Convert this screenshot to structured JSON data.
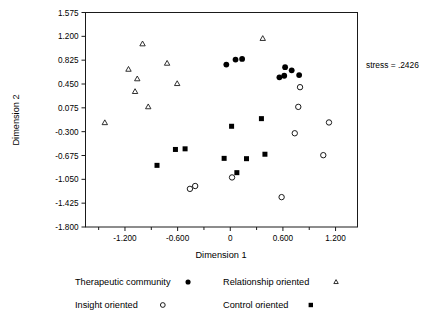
{
  "chart_data": {
    "type": "scatter",
    "title": "",
    "subtitle": "",
    "xlabel": "Dimension 1",
    "ylabel": "Dimension 2",
    "xlim": [
      -1.65,
      1.45
    ],
    "ylim": [
      -1.8,
      1.575
    ],
    "grid": false,
    "legend_position": "below-plot",
    "annotations": [
      {
        "name": "stress-annotation",
        "text": "stress = .2426",
        "value": 0.2426
      }
    ],
    "xticks": [
      -1.2,
      -0.6,
      0,
      0.6,
      1.2
    ],
    "xtick_labels": [
      "-1.200",
      "-0.600",
      "0",
      "0.600",
      "1.200"
    ],
    "yticks": [
      1.575,
      1.2,
      0.825,
      0.45,
      0.075,
      -0.3,
      -0.675,
      -1.05,
      -1.425,
      -1.8
    ],
    "ytick_labels": [
      "1.575",
      "1.200",
      "0.825",
      "0.450",
      "0.075",
      "-0.300",
      "-0.675",
      "-1.050",
      "-1.425",
      "-1.800"
    ],
    "series": [
      {
        "name": "Therapeutic community",
        "marker": "filled-circle",
        "color": "#000000",
        "points": [
          {
            "x": -0.045,
            "y": 0.755
          },
          {
            "x": 0.06,
            "y": 0.835
          },
          {
            "x": 0.135,
            "y": 0.845
          },
          {
            "x": 0.56,
            "y": 0.555
          },
          {
            "x": 0.615,
            "y": 0.58
          },
          {
            "x": 0.625,
            "y": 0.715
          },
          {
            "x": 0.7,
            "y": 0.665
          },
          {
            "x": 0.785,
            "y": 0.59
          }
        ]
      },
      {
        "name": "Relationship oriented",
        "marker": "open-triangle",
        "color": "#1a1a1a",
        "points": [
          {
            "x": -1.0,
            "y": 1.08
          },
          {
            "x": -1.16,
            "y": 0.68
          },
          {
            "x": -0.72,
            "y": 0.775
          },
          {
            "x": -1.06,
            "y": 0.53
          },
          {
            "x": -0.605,
            "y": 0.455
          },
          {
            "x": -1.085,
            "y": 0.33
          },
          {
            "x": -0.935,
            "y": 0.09
          },
          {
            "x": -1.43,
            "y": -0.16
          },
          {
            "x": 0.37,
            "y": 1.165
          }
        ]
      },
      {
        "name": "Insight oriented",
        "marker": "open-circle",
        "color": "#1a1a1a",
        "points": [
          {
            "x": 0.795,
            "y": 0.4
          },
          {
            "x": 0.775,
            "y": 0.09
          },
          {
            "x": 1.125,
            "y": -0.155
          },
          {
            "x": 0.735,
            "y": -0.325
          },
          {
            "x": 1.06,
            "y": -0.67
          },
          {
            "x": 0.585,
            "y": -1.33
          },
          {
            "x": 0.02,
            "y": -1.02
          },
          {
            "x": -0.46,
            "y": -1.2
          },
          {
            "x": -0.4,
            "y": -1.155
          }
        ]
      },
      {
        "name": "Control oriented",
        "marker": "filled-square",
        "color": "#000000",
        "points": [
          {
            "x": 0.015,
            "y": -0.215
          },
          {
            "x": 0.355,
            "y": -0.095
          },
          {
            "x": -0.625,
            "y": -0.58
          },
          {
            "x": -0.515,
            "y": -0.57
          },
          {
            "x": -0.835,
            "y": -0.83
          },
          {
            "x": -0.07,
            "y": -0.72
          },
          {
            "x": 0.185,
            "y": -0.725
          },
          {
            "x": 0.395,
            "y": -0.655
          },
          {
            "x": 0.075,
            "y": -0.945
          }
        ]
      }
    ]
  },
  "axes": {
    "x_title": "Dimension 1",
    "y_title": "Dimension 2"
  },
  "legend": {
    "entries": [
      {
        "label": "Therapeutic community",
        "marker": "filled-circle"
      },
      {
        "label": "Relationship oriented",
        "marker": "open-triangle"
      },
      {
        "label": "Insight oriented",
        "marker": "open-circle"
      },
      {
        "label": "Control oriented",
        "marker": "filled-square"
      }
    ]
  },
  "annotation": {
    "stress_text": "stress = .2426"
  }
}
